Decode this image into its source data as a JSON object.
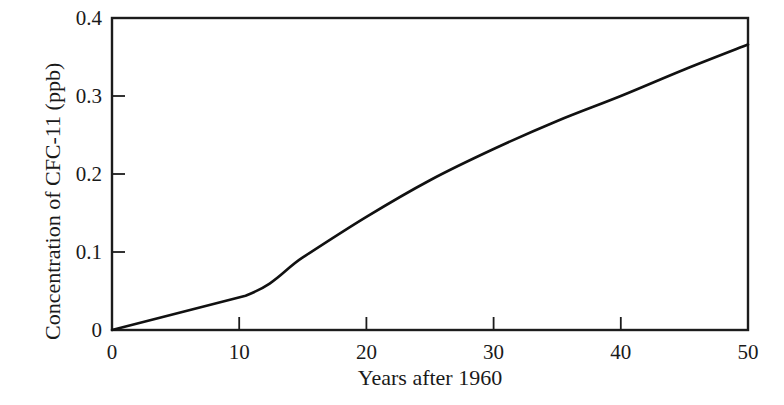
{
  "chart_data": {
    "type": "line",
    "title": "",
    "xlabel": "Years after 1960",
    "ylabel": "Concentration of CFC-11 (ppb)",
    "xlim": [
      0,
      50
    ],
    "ylim": [
      0,
      0.4
    ],
    "xticks": [
      "0",
      "10",
      "20",
      "30",
      "40",
      "50"
    ],
    "xtick_values": [
      0,
      10,
      20,
      30,
      40,
      50
    ],
    "yticks": [
      "0",
      "0.1",
      "0.2",
      "0.3",
      "0.4"
    ],
    "ytick_values": [
      0,
      0.1,
      0.2,
      0.3,
      0.4
    ],
    "grid": false,
    "legend": null,
    "series": [
      {
        "name": "CFC-11 concentration",
        "color": "#111111",
        "x": [
          0,
          10.5,
          15,
          20,
          25,
          30,
          35,
          40,
          45,
          50
        ],
        "values": [
          0,
          0.044,
          0.093,
          0.145,
          0.192,
          0.232,
          0.268,
          0.3,
          0.334,
          0.366
        ]
      }
    ],
    "annotations": []
  },
  "axis": {
    "x_title": "Years after 1960",
    "y_title": "Concentration of CFC-11 (ppb)"
  },
  "colors": {
    "background": "#ffffff",
    "axis": "#1c1c1c",
    "curve": "#111111",
    "text": "#1a1a1a"
  }
}
